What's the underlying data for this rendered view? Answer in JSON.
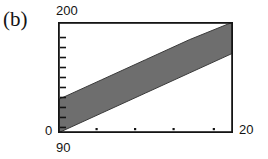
{
  "figure": {
    "panel_label": "(b)",
    "background_color": "#ffffff",
    "frame_color": "#141414",
    "band_color": "#6e6e6e",
    "band_edge_color": "#3a3a3a"
  },
  "chart_data": {
    "type": "area",
    "title": "(b)",
    "subtitle": "",
    "xlabel": "",
    "ylabel": "",
    "xlim": [
      90,
      20
    ],
    "ylim": [
      0,
      200
    ],
    "x_axis": {
      "min_label": "90",
      "max_label": "20",
      "min_value": 90,
      "max_value": 20,
      "tick_count": 4,
      "tick_style": "dot",
      "tick_positions_fraction": [
        0.22,
        0.44,
        0.66,
        0.89
      ]
    },
    "y_axis": {
      "min_label": "0",
      "max_label": "200",
      "min_value": 0,
      "max_value": 200,
      "tick_count": 10,
      "tick_style": "inward-line",
      "tick_positions_fraction": [
        0.05,
        0.14,
        0.23,
        0.32,
        0.41,
        0.5,
        0.59,
        0.68,
        0.77,
        0.86
      ]
    },
    "grid": false,
    "legend": null,
    "series": [
      {
        "name": "band",
        "kind": "filled-band",
        "fill": "#6e6e6e",
        "x": [
          0.0,
          0.25,
          0.5,
          0.75,
          1.0
        ],
        "y_upper": [
          0.3,
          0.48,
          0.66,
          0.84,
          1.0
        ],
        "y_lower": [
          0.0,
          0.18,
          0.36,
          0.54,
          0.72
        ],
        "description": "Diagonal shaded band rising from lower-left to upper-right"
      }
    ],
    "annotations": []
  }
}
